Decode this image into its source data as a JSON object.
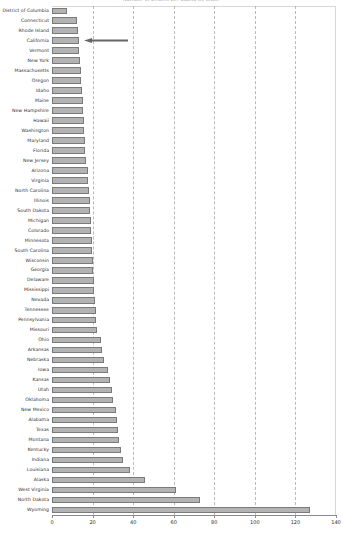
{
  "chart_data": {
    "type": "bar",
    "orientation": "horizontal",
    "title": "Number of Deaths per Capita by State",
    "xlabel": "",
    "ylabel": "",
    "xlim": [
      0,
      140
    ],
    "xticks": [
      0,
      20,
      40,
      60,
      80,
      100,
      120,
      140
    ],
    "gridlines": [
      20,
      40,
      60,
      80,
      100,
      120
    ],
    "grid": true,
    "legend": null,
    "bar_color": "#b3b3b3",
    "bar_edge_color": "#7a7a7a",
    "categories": [
      "District of Columbia",
      "Connecticut",
      "Rhode Island",
      "California",
      "Vermont",
      "New York",
      "Massachusetts",
      "Oregon",
      "Idaho",
      "Maine",
      "New Hampshire",
      "Hawaii",
      "Washington",
      "Maryland",
      "Florida",
      "New Jersey",
      "Arizona",
      "Virginia",
      "North Carolina",
      "Illinois",
      "South Dakota",
      "Michigan",
      "Colorado",
      "Minnesota",
      "South Carolina",
      "Wisconsin",
      "Georgia",
      "Delaware",
      "Mississippi",
      "Nevada",
      "Tennessee",
      "Pennsylvania",
      "Missouri",
      "Ohio",
      "Arkansas",
      "Nebraska",
      "Iowa",
      "Kansas",
      "Utah",
      "Oklahoma",
      "New Mexico",
      "Alabama",
      "Texas",
      "Montana",
      "Kentucky",
      "Indiana",
      "Louisiana",
      "Alaska",
      "West Virginia",
      "North Dakota",
      "Wyoming"
    ],
    "values": [
      7.5,
      12.5,
      13.0,
      13.2,
      13.5,
      14.0,
      14.3,
      14.5,
      14.8,
      15.2,
      15.5,
      15.8,
      16.0,
      16.2,
      16.5,
      16.8,
      17.5,
      17.8,
      18.2,
      18.5,
      18.8,
      19.0,
      19.2,
      19.5,
      19.8,
      20.0,
      20.2,
      20.5,
      20.8,
      21.0,
      21.5,
      21.8,
      22.2,
      24.0,
      24.5,
      25.5,
      27.5,
      28.5,
      29.5,
      30.0,
      31.5,
      32.0,
      32.5,
      33.0,
      34.0,
      35.0,
      38.5,
      46.0,
      61.0,
      73.0,
      127.0
    ],
    "annotations": [
      {
        "name": "california-callout-arrow",
        "points_to_category": "California",
        "direction": "left",
        "color": "#666666"
      }
    ]
  }
}
